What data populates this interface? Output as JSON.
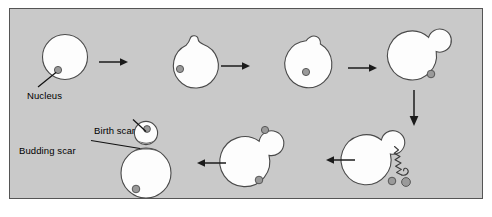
{
  "figure": {
    "panel_background": "#c9c9c9",
    "panel_border": "#555555",
    "cell_fill": "#fdfdfd",
    "cell_stroke": "#4a4a4a",
    "nucleus_color": "#9a9a9a",
    "scar_color": "#5d5d5d",
    "arrow_color": "#1b1b1b"
  },
  "labels": {
    "nucleus": "Nucleus",
    "birth_scar": "Birth scar",
    "budding_scar": "Budding scar"
  },
  "stages": [
    {
      "id": "stage-1-unbudded-cell",
      "name": "unbudded mother cell",
      "nuclei": 1,
      "bud": "none",
      "scars": []
    },
    {
      "id": "stage-2-bud-emergence",
      "name": "bud emergence",
      "nuclei": 1,
      "bud": "tiny",
      "scars": []
    },
    {
      "id": "stage-3-small-bud",
      "name": "small bud",
      "nuclei": 1,
      "bud": "small",
      "scars": []
    },
    {
      "id": "stage-4-growing-bud",
      "name": "growing bud",
      "nuclei": 1,
      "bud": "medium",
      "scars": []
    },
    {
      "id": "stage-5-nuclear-division",
      "name": "nuclear division with spindle",
      "nuclei": 2,
      "bud": "medium",
      "scars": [],
      "spindle": true
    },
    {
      "id": "stage-6-nucleus-migrated",
      "name": "nucleus migrated into bud",
      "nuclei": 2,
      "bud": "large",
      "scars": []
    },
    {
      "id": "stage-7-cell-separation",
      "name": "cell separation, daughter released",
      "nuclei": 2,
      "bud": "separated",
      "scars": [
        "birth scar",
        "budding scar"
      ]
    }
  ],
  "arrows": [
    {
      "id": "arrow-1",
      "direction": "right",
      "from": "stage-1-unbudded-cell",
      "to": "stage-2-bud-emergence"
    },
    {
      "id": "arrow-2",
      "direction": "right",
      "from": "stage-2-bud-emergence",
      "to": "stage-3-small-bud"
    },
    {
      "id": "arrow-3",
      "direction": "right",
      "from": "stage-3-small-bud",
      "to": "stage-4-growing-bud"
    },
    {
      "id": "arrow-4",
      "direction": "down",
      "from": "stage-4-growing-bud",
      "to": "stage-5-nuclear-division"
    },
    {
      "id": "arrow-5",
      "direction": "left",
      "from": "stage-5-nuclear-division",
      "to": "stage-6-nucleus-migrated"
    },
    {
      "id": "arrow-6",
      "direction": "left",
      "from": "stage-6-nucleus-migrated",
      "to": "stage-7-cell-separation"
    }
  ]
}
